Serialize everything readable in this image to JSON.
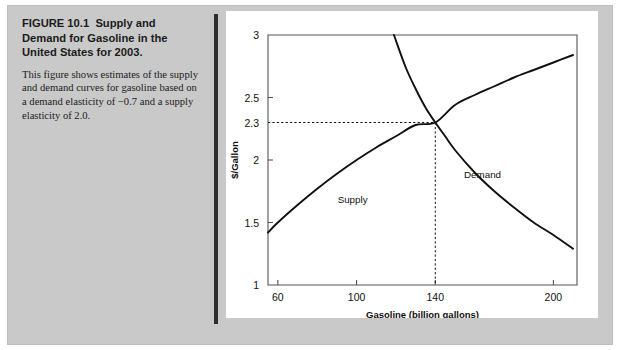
{
  "figure": {
    "number_label": "FIGURE 10.1",
    "title": "Supply and Demand for Gasoline in the United States for 2003.",
    "body": "This figure shows estimates of the supply and demand curves for gasoline based on a demand elasticity of −0.7 and a supply elasticity of 2.0."
  },
  "colors": {
    "mat": "#c9c9c9",
    "panel": "#ffffff",
    "divider": "#2e2e2e",
    "ink": "#111111",
    "curve": "#101010"
  },
  "chart_data": {
    "type": "line",
    "title": "",
    "xlabel": "Gasoline (billion gallons)",
    "ylabel": "$/Gallon",
    "xlim": [
      55,
      212
    ],
    "ylim": [
      1,
      3
    ],
    "xticks": [
      60,
      100,
      140,
      200
    ],
    "xtick_labels": [
      "60",
      "100",
      "140",
      "200"
    ],
    "yticks": [
      1,
      1.5,
      2,
      2.3,
      2.5,
      3
    ],
    "ytick_labels": [
      "1",
      "1.5",
      "2",
      "2.3",
      "2.5",
      "3"
    ],
    "grid": false,
    "legend": "inline-labels",
    "equilibrium": {
      "x": 140,
      "y": 2.3,
      "x_label": "140",
      "y_label": "2.3"
    },
    "series": [
      {
        "name": "Supply",
        "label": "Supply",
        "label_at": {
          "x": 98,
          "y": 1.66
        },
        "elasticity": 2.0,
        "x": [
          55,
          60,
          70,
          80,
          90,
          100,
          110,
          120,
          130,
          140,
          150,
          160,
          170,
          180,
          190,
          200,
          210
        ],
        "y": [
          1.42,
          1.5,
          1.64,
          1.77,
          1.89,
          2.0,
          2.1,
          2.19,
          2.28,
          2.3,
          2.44,
          2.52,
          2.59,
          2.66,
          2.72,
          2.78,
          2.84
        ]
      },
      {
        "name": "Demand",
        "label": "Demand",
        "label_at": {
          "x": 164,
          "y": 1.86
        },
        "elasticity": -0.7,
        "x": [
          119,
          125,
          130,
          135,
          140,
          145,
          150,
          160,
          170,
          180,
          190,
          200,
          210
        ],
        "y": [
          3.0,
          2.74,
          2.57,
          2.42,
          2.3,
          2.19,
          2.08,
          1.9,
          1.75,
          1.62,
          1.5,
          1.4,
          1.29
        ]
      }
    ]
  }
}
